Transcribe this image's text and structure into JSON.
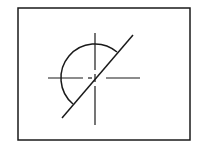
{
  "diagram": {
    "type": "technical-line-drawing",
    "colors": {
      "background": "#ffffff",
      "stroke": "#1a1a1a"
    },
    "frame": {
      "x": 18,
      "y": 8,
      "width": 172,
      "height": 132
    },
    "center": {
      "x": 95,
      "y": 78
    },
    "semicircle": {
      "radius": 34,
      "start": {
        "x": 117,
        "y": 52
      },
      "end": {
        "x": 73,
        "y": 104
      }
    },
    "diagonal_line": {
      "x1": 62,
      "y1": 118,
      "x2": 133,
      "y2": 35
    },
    "center_lines": {
      "horizontal": [
        {
          "x1": 48,
          "x2": 83
        },
        {
          "x1": 88,
          "x2": 92
        },
        {
          "x1": 106,
          "x2": 140
        }
      ],
      "vertical": [
        {
          "y1": 33,
          "y2": 70
        },
        {
          "y1": 74,
          "y2": 82
        },
        {
          "y1": 86,
          "y2": 125
        }
      ]
    }
  }
}
